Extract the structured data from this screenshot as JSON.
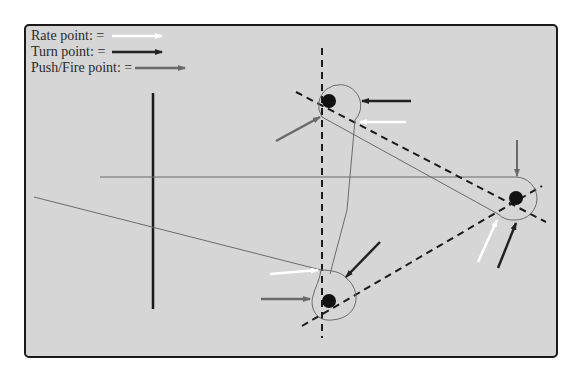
{
  "legend": {
    "items": [
      {
        "label": "Rate point: =",
        "arrow_color": "#ffffff",
        "icon": "white-arrow-icon"
      },
      {
        "label": "Turn point: =",
        "arrow_color": "#222222",
        "icon": "black-arrow-icon"
      },
      {
        "label": "Push/Fire point: =",
        "arrow_color": "#6a6a6a",
        "icon": "gray-arrow-icon"
      }
    ]
  },
  "colors": {
    "background": "#d6d6d6",
    "frame_border": "#1a1a1a",
    "rate_arrow": "#ffffff",
    "turn_arrow": "#222222",
    "push_fire_arrow": "#6a6a6a",
    "course_line": "#6a6a6a",
    "dashed_line": "#1a1a1a",
    "waypoint": "#111111"
  },
  "waypoints": [
    {
      "name": "top",
      "x": 329,
      "y": 101
    },
    {
      "name": "right",
      "x": 516,
      "y": 198
    },
    {
      "name": "bottom",
      "x": 329,
      "y": 301
    }
  ]
}
